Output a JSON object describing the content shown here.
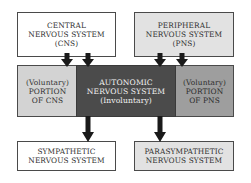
{
  "diagram": {
    "nodes": {
      "cns": {
        "lines": [
          "CENTRAL",
          "NERVOUS SYSTEM",
          "(CNS)"
        ]
      },
      "pns": {
        "lines": [
          "PERIPHERAL",
          "NERVOUS SYSTEM",
          "(PNS)"
        ]
      },
      "voluntary_cns": {
        "lines": [
          "(Voluntary)",
          "PORTION",
          "OF CNS"
        ]
      },
      "ans": {
        "lines": [
          "AUTONOMIC",
          "NERVOUS SYSTEM",
          "(Involuntary)"
        ]
      },
      "voluntary_pns": {
        "lines": [
          "(Voluntary)",
          "PORTION",
          "OF PNS"
        ]
      },
      "sympathetic": {
        "lines": [
          "SYMPATHETIC",
          "NERVOUS SYSTEM"
        ]
      },
      "parasympathetic": {
        "lines": [
          "PARASYMPATHETIC",
          "NERVOUS SYSTEM"
        ]
      }
    },
    "edges": [
      {
        "from": "cns",
        "to": "voluntary_cns"
      },
      {
        "from": "cns",
        "to": "ans"
      },
      {
        "from": "pns",
        "to": "ans"
      },
      {
        "from": "pns",
        "to": "voluntary_pns"
      },
      {
        "from": "ans",
        "to": "sympathetic"
      },
      {
        "from": "ans",
        "to": "parasympathetic"
      }
    ],
    "colors": {
      "white_box": "#ffffff",
      "light_gray_box": "#e2e2e2",
      "voluntary_cns": "#d3d3d3",
      "autonomic": "#4b4b4b",
      "voluntary_pns": "#9e9e9e",
      "arrow": "#1a1a1a"
    }
  }
}
